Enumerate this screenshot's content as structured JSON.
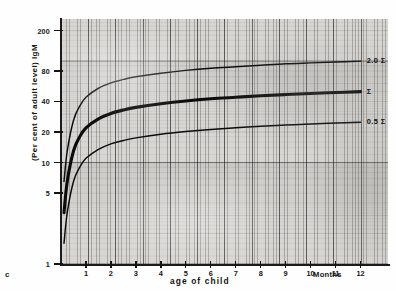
{
  "figure": {
    "corner_mark": "c"
  },
  "chart_data": {
    "type": "line",
    "title": "",
    "subtitle": "",
    "xlabel": "age of child",
    "x_unit_label": "Months",
    "ylabel": "(Per cent of adult level)  IgM",
    "yscale": "log",
    "xscale": "linear",
    "xlim": [
      0,
      13.1
    ],
    "ylim": [
      1,
      260
    ],
    "grid": "semi-log graph paper, fine minor grid with bold decade/major lines",
    "legend_position": "inline end-of-curve labels",
    "x_ticks": [
      1,
      2,
      3,
      4,
      5,
      6,
      7,
      8,
      9,
      10,
      11,
      12
    ],
    "x_tick_labels": [
      "1",
      "2",
      "3",
      "4",
      "5",
      "6",
      "7",
      "8",
      "9",
      "10",
      "11",
      "12"
    ],
    "y_ticks": [
      1,
      5,
      10,
      20,
      40,
      80,
      200
    ],
    "y_tick_labels": [
      "1",
      "5",
      "10",
      "20",
      "40",
      "80",
      "200"
    ],
    "x": [
      0.12,
      0.25,
      0.5,
      0.75,
      1,
      1.5,
      2,
      2.5,
      3,
      4,
      5,
      6,
      7,
      8,
      9,
      10,
      11,
      12
    ],
    "series": [
      {
        "name": "2.0 Σ",
        "label": "2.0 Σ",
        "linewidth": "thin",
        "values": [
          6.5,
          13,
          26,
          36,
          44,
          54,
          61,
          66,
          70,
          76,
          81,
          85,
          88,
          91,
          94,
          96,
          98,
          100
        ]
      },
      {
        "name": "Σ",
        "label": "Σ",
        "linewidth": "thick",
        "values": [
          3.2,
          6.5,
          13,
          18,
          22,
          27,
          30.5,
          33,
          35,
          38,
          40.5,
          42.5,
          44,
          45.5,
          46.8,
          48,
          49,
          50
        ]
      },
      {
        "name": "0.5 Σ",
        "label": "0.5 Σ",
        "linewidth": "thin",
        "values": [
          1.6,
          3.2,
          6.5,
          9,
          11,
          13.5,
          15.3,
          16.5,
          17.5,
          19,
          20.2,
          21.2,
          22,
          22.8,
          23.4,
          24,
          24.5,
          25
        ]
      }
    ],
    "annotations": [
      {
        "text": "2.0 Σ",
        "x": 12.25,
        "y": 100
      },
      {
        "text": "Σ",
        "x": 12.25,
        "y": 50
      },
      {
        "text": "0.5 Σ",
        "x": 12.25,
        "y": 25
      }
    ]
  }
}
